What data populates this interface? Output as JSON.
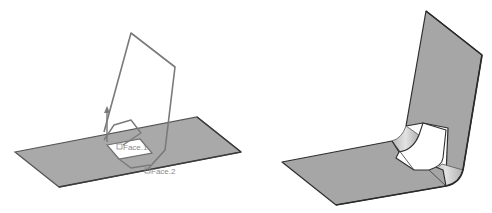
{
  "figure": {
    "left_view": {
      "description": "Sheet metal flange preview with profile sketch",
      "labels": {
        "face1": "Face.1",
        "face2": "Face.2"
      },
      "colors": {
        "plate_fill": "#a9a9a9",
        "plate_edge": "#4a4a4a",
        "profile_stroke": "#7a7a7a",
        "label": "#8a8a8a"
      }
    },
    "right_view": {
      "description": "Resulting bent sheet metal part with cutout",
      "colors": {
        "plate_fill": "#a6a6a6",
        "bend_fill": "#cfcfcf",
        "edge": "#2e2e2e"
      }
    }
  }
}
